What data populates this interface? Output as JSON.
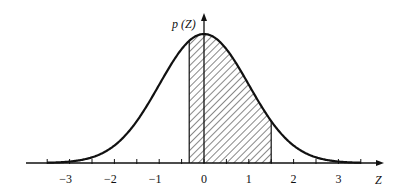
{
  "chart_data": {
    "type": "area",
    "title": "",
    "xlabel": "Z",
    "ylabel": "p (Z)",
    "xlim": [
      -3.5,
      3.5
    ],
    "x_ticks_major": [
      -3,
      -2,
      -1,
      0,
      1,
      2,
      3
    ],
    "x_tick_labels": [
      "−3",
      "−2",
      "−1",
      "0",
      "1",
      "2",
      "3"
    ],
    "x_ticks_minor": [
      -3.5,
      -2.5,
      -1.5,
      -0.5,
      0.5,
      1.5,
      2.5,
      3.5
    ],
    "grid": false,
    "legend": null,
    "series": [
      {
        "name": "p(Z)",
        "function": "standard normal pdf",
        "mean": 0,
        "std": 1
      }
    ],
    "shaded_region": {
      "from": -0.33,
      "to": 1.5,
      "pattern": "diagonal hatch"
    }
  },
  "labels": {
    "y_axis": "p (Z)",
    "x_axis": "Z",
    "ticks": [
      "−3",
      "−2",
      "−1",
      "0",
      "1",
      "2",
      "3"
    ]
  }
}
